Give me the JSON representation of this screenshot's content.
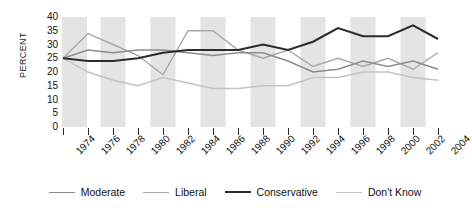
{
  "chart_data": {
    "type": "line",
    "title": "",
    "xlabel": "",
    "ylabel": "PERCENT",
    "ylim": [
      0,
      40
    ],
    "ytick_step": 5,
    "yticks": [
      "40",
      "35",
      "30",
      "25",
      "20",
      "15",
      "10",
      "5",
      "0"
    ],
    "grid": "vertical-alternating-bands",
    "legend_position": "bottom",
    "categories": [
      "1974",
      "1976",
      "1978",
      "1980",
      "1982",
      "1984",
      "1986",
      "1988",
      "1990",
      "1992",
      "1994",
      "1996",
      "1998",
      "2000",
      "2002",
      "2004"
    ],
    "series": [
      {
        "name": "Moderate",
        "color": "#8c8c8c",
        "width": 1.4,
        "values": [
          25,
          28,
          27,
          28,
          28,
          27,
          26,
          27,
          27,
          24,
          20,
          21,
          24,
          22,
          24,
          21
        ]
      },
      {
        "name": "Liberal",
        "color": "#a8a8a8",
        "width": 1.4,
        "values": [
          25,
          34,
          30,
          26,
          19,
          35,
          35,
          28,
          25,
          28,
          22,
          25,
          22,
          25,
          21,
          27
        ]
      },
      {
        "name": "Conservative",
        "color": "#2b2b2b",
        "width": 2.0,
        "values": [
          25,
          24,
          24,
          25,
          27,
          28,
          28,
          28,
          30,
          28,
          31,
          36,
          33,
          33,
          37,
          32
        ]
      },
      {
        "name": "Don't Know",
        "color": "#c4c4c4",
        "width": 1.4,
        "values": [
          25,
          20,
          17,
          15,
          18,
          16,
          14,
          14,
          15,
          15,
          18,
          18,
          20,
          20,
          18,
          17
        ]
      }
    ]
  },
  "legend": {
    "items": [
      {
        "label": "Moderate"
      },
      {
        "label": "Liberal"
      },
      {
        "label": "Conservative"
      },
      {
        "label": "Don't Know"
      }
    ]
  },
  "axis": {
    "y_title": "PERCENT"
  }
}
